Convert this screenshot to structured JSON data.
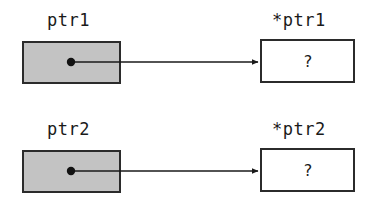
{
  "diagram": {
    "background_color": "#ffffff",
    "pointer_box_fill": "#c3c3c3",
    "target_box_fill": "#ffffff",
    "stroke_color": "#2b2b2b",
    "rows": [
      {
        "pointer_label": "ptr1",
        "target_label": "*ptr1",
        "target_value": "?",
        "pointer_box": {
          "x": 22,
          "y": 41,
          "w": 99,
          "h": 43
        },
        "target_box": {
          "x": 260,
          "y": 39,
          "w": 95,
          "h": 44
        },
        "dot": {
          "x": 71,
          "y": 62,
          "r": 4
        },
        "arrow": {
          "x1": 71,
          "y1": 62,
          "x2": 260,
          "y2": 62
        },
        "pointer_label_pos": {
          "x": 47,
          "y": 12
        },
        "target_label_pos": {
          "x": 272,
          "y": 12
        },
        "value_pos": {
          "x": 303,
          "y": 54
        }
      },
      {
        "pointer_label": "ptr2",
        "target_label": "*ptr2",
        "target_value": "?",
        "pointer_box": {
          "x": 22,
          "y": 150,
          "w": 99,
          "h": 43
        },
        "target_box": {
          "x": 260,
          "y": 148,
          "w": 95,
          "h": 44
        },
        "dot": {
          "x": 71,
          "y": 171,
          "r": 4
        },
        "arrow": {
          "x1": 71,
          "y1": 171,
          "x2": 260,
          "y2": 171
        },
        "pointer_label_pos": {
          "x": 47,
          "y": 121
        },
        "target_label_pos": {
          "x": 272,
          "y": 121
        },
        "value_pos": {
          "x": 303,
          "y": 163
        }
      }
    ]
  }
}
